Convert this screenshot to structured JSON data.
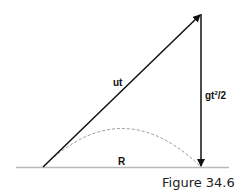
{
  "figure": {
    "caption": "Figure 34.6",
    "labels": {
      "displacement": "ut",
      "drop_prefix": "gt",
      "drop_exponent": "2",
      "drop_suffix": "/2",
      "range": "R"
    },
    "colors": {
      "line": "#111111",
      "ground": "#b8b8b8",
      "trajectory": "#999999",
      "text": "#111111"
    }
  }
}
